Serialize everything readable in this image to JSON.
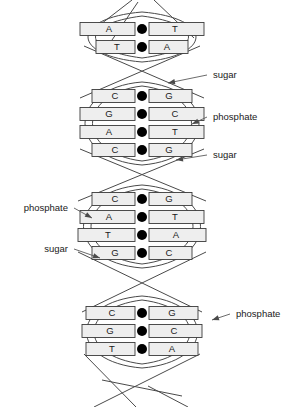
{
  "figure": {
    "type": "diagram",
    "background": "#ffffff",
    "rung_fill": "#eeeeee",
    "rung_stroke": "#3a3a3a",
    "node_color": "#000000",
    "strand_color": "#4a4a4a"
  },
  "base_pairs": [
    {
      "left": "A",
      "right": "T",
      "y": 29,
      "half": 62,
      "section": 1
    },
    {
      "left": "T",
      "right": "A",
      "y": 47,
      "half": 46,
      "section": 1
    },
    {
      "left": "C",
      "right": "G",
      "y": 96,
      "half": 50,
      "section": 2
    },
    {
      "left": "G",
      "right": "C",
      "y": 114,
      "half": 62,
      "section": 2
    },
    {
      "left": "A",
      "right": "T",
      "y": 132,
      "half": 62,
      "section": 2
    },
    {
      "left": "C",
      "right": "G",
      "y": 150,
      "half": 50,
      "section": 2
    },
    {
      "left": "C",
      "right": "G",
      "y": 199,
      "half": 50,
      "section": 3
    },
    {
      "left": "A",
      "right": "T",
      "y": 217,
      "half": 62,
      "section": 3
    },
    {
      "left": "T",
      "right": "A",
      "y": 235,
      "half": 64,
      "section": 3
    },
    {
      "left": "G",
      "right": "C",
      "y": 253,
      "half": 50,
      "section": 3
    },
    {
      "left": "C",
      "right": "G",
      "y": 313,
      "half": 56,
      "section": 4
    },
    {
      "left": "G",
      "right": "C",
      "y": 331,
      "half": 60,
      "section": 4
    },
    {
      "left": "T",
      "right": "A",
      "y": 349,
      "half": 56,
      "section": 4
    }
  ],
  "annotations": [
    {
      "id": "sugar-top-right",
      "text": "sugar",
      "side": "right",
      "text_x": 213,
      "text_y": 75,
      "tip_x": 168,
      "tip_y": 83
    },
    {
      "id": "phosphate-right",
      "text": "phosphate",
      "side": "right",
      "text_x": 213,
      "text_y": 117,
      "tip_x": 192,
      "tip_y": 124
    },
    {
      "id": "sugar-mid-right",
      "text": "sugar",
      "side": "right",
      "text_x": 213,
      "text_y": 155,
      "tip_x": 176,
      "tip_y": 160
    },
    {
      "id": "phosphate-left",
      "text": "phosphate",
      "side": "left",
      "text_x": 68,
      "text_y": 208,
      "tip_x": 92,
      "tip_y": 218
    },
    {
      "id": "sugar-left",
      "text": "sugar",
      "side": "left",
      "text_x": 68,
      "text_y": 249,
      "tip_x": 100,
      "tip_y": 258
    },
    {
      "id": "phosphate-bot-right",
      "text": "phosphate",
      "side": "right",
      "text_x": 236,
      "text_y": 314,
      "tip_x": 212,
      "tip_y": 320
    }
  ],
  "backbone": {
    "centerline_x": 142,
    "sections": [
      {
        "top": 12,
        "bottom": 62,
        "half_width": 72
      },
      {
        "top": 82,
        "bottom": 165,
        "half_width": 76
      },
      {
        "top": 185,
        "bottom": 268,
        "half_width": 78
      },
      {
        "top": 296,
        "bottom": 368,
        "half_width": 74
      }
    ]
  }
}
